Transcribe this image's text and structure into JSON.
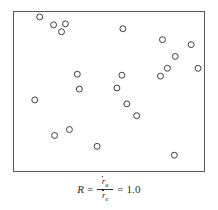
{
  "figure": {
    "caption": {
      "lhs_symbol": "R",
      "equals_1": "=",
      "numerator_base": "r",
      "numerator_subscript": "a",
      "denominator_base": "r",
      "denominator_subscript": "e",
      "equals_2": "=",
      "value": "1.0",
      "full_text": "R = ra / re = 1.0"
    },
    "frame": {
      "stroke_color": "#59595c",
      "fill_color": "#ffffff",
      "x": 13,
      "y": 11,
      "width": 192,
      "height": 161
    },
    "marker": {
      "shape": "open-circle",
      "radius": 3,
      "stroke_color": "#3d3d42",
      "fill": "none"
    }
  },
  "chart_data": {
    "type": "scatter",
    "title": "",
    "subtitle": "",
    "xlabel": "",
    "ylabel": "",
    "xlim": [
      0,
      192
    ],
    "ylim": [
      0,
      161
    ],
    "grid": false,
    "legend": false,
    "axis_ticks": false,
    "point_count": 24,
    "annotations": [
      "R = ra / re = 1.0"
    ],
    "series": [
      {
        "name": "random points",
        "marker": "open-circle",
        "color": "#3d3d42",
        "points": [
          [
            26,
            5
          ],
          [
            40,
            13
          ],
          [
            52,
            12
          ],
          [
            48,
            20
          ],
          [
            110,
            17
          ],
          [
            150,
            28
          ],
          [
            179,
            33
          ],
          [
            163,
            45
          ],
          [
            155,
            57
          ],
          [
            186,
            57
          ],
          [
            148,
            65
          ],
          [
            64,
            63
          ],
          [
            109,
            64
          ],
          [
            66,
            78
          ],
          [
            104,
            77
          ],
          [
            21,
            89
          ],
          [
            114,
            93
          ],
          [
            124,
            105
          ],
          [
            56,
            119
          ],
          [
            41,
            125
          ],
          [
            84,
            136
          ],
          [
            162,
            145
          ]
        ]
      }
    ]
  }
}
